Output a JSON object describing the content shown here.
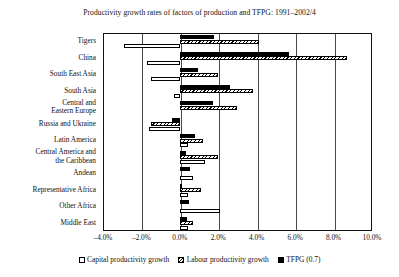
{
  "chart_data": {
    "type": "bar",
    "orientation": "horizontal",
    "title": "Productivity growth rates of factors of production and TFPG: 1991–2002/4",
    "xlabel": "",
    "ylabel": "",
    "xlim": [
      -4.0,
      10.0
    ],
    "xticks": [
      -4.0,
      -2.0,
      0.0,
      2.0,
      4.0,
      6.0,
      8.0,
      10.0
    ],
    "xtick_labels": [
      "–4.0%",
      "–2.0%",
      "0.0%",
      "2.0%",
      "4.0%",
      "6.0%",
      "8.0%",
      "10.0%"
    ],
    "grid": true,
    "grid_axis": "x",
    "legend_position": "bottom",
    "categories": [
      "Tigers",
      "China",
      "South East Asia",
      "South Asia",
      "Central and\nEastern Europe",
      "Russia and Ukraine",
      "Latin America",
      "Central America and\nthe Caribbean",
      "Andean",
      "Representative Africa",
      "Other Africa",
      "Middle East"
    ],
    "series": [
      {
        "name": "Capital productivity growth",
        "color": "#ffffff",
        "pattern": "open",
        "values": [
          -2.9,
          -1.7,
          -1.5,
          -0.3,
          0.0,
          -1.6,
          0.4,
          1.3,
          0.7,
          0.4,
          2.1,
          0.4
        ]
      },
      {
        "name": "Labour productivity growth",
        "color": "#000000",
        "pattern": "hatched",
        "values": [
          4.1,
          8.7,
          2.0,
          3.8,
          3.0,
          -1.5,
          1.2,
          2.0,
          0.0,
          1.1,
          0.0,
          0.7
        ]
      },
      {
        "name": "TFPG (0.7)",
        "color": "#000000",
        "pattern": "solid",
        "values": [
          1.8,
          5.7,
          0.95,
          2.6,
          1.7,
          -0.4,
          0.8,
          0.3,
          0.55,
          0.1,
          0.5,
          0.35
        ]
      }
    ]
  },
  "legend": {
    "items": [
      {
        "label": "Capital productivity growth",
        "swatch": "capital"
      },
      {
        "label": "Labour productivity growth",
        "swatch": "labour"
      },
      {
        "label": "TFPG (0.7)",
        "swatch": "tfpg"
      }
    ]
  }
}
